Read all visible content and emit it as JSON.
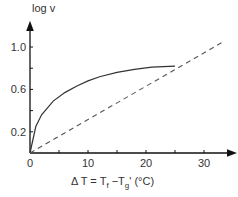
{
  "chart_data": {
    "type": "line",
    "title": "",
    "xlabel": "ΔT = Tf − Tg' (°C)",
    "ylabel": "log v",
    "xlim": [
      0,
      35
    ],
    "ylim": [
      0,
      1.2
    ],
    "x_ticks": [
      0,
      10,
      20,
      30
    ],
    "x_tick_labels": [
      "0",
      "10",
      "20",
      "30"
    ],
    "y_ticks": [
      0.2,
      0.6,
      1.0
    ],
    "y_tick_labels": [
      "0.2",
      "0.6",
      "1.0"
    ],
    "grid": false,
    "legend": null,
    "series": [
      {
        "name": "measured (solid curve)",
        "style": "solid",
        "x": [
          0,
          1,
          2,
          4,
          6,
          8,
          10,
          12,
          15,
          18,
          21,
          25
        ],
        "values": [
          0.0,
          0.25,
          0.36,
          0.49,
          0.57,
          0.63,
          0.68,
          0.72,
          0.76,
          0.79,
          0.81,
          0.82
        ]
      },
      {
        "name": "linear (dashed line)",
        "style": "dashed",
        "x": [
          0,
          33
        ],
        "values": [
          0.0,
          1.04
        ]
      }
    ]
  },
  "labels": {
    "y_axis": "log  v",
    "x_axis_prefix": "Δ T = T",
    "x_axis_sub_f": "f",
    "x_axis_mid": " −T",
    "x_axis_sub_g": "g",
    "x_axis_suffix": "'  (°C)"
  }
}
